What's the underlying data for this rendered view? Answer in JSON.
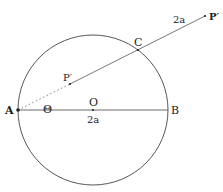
{
  "diagram": {
    "labels": {
      "A": "A",
      "B": "B",
      "O": "O",
      "C": "C",
      "P_inner": "P′",
      "P_outer": "P′",
      "theta": "Θ",
      "diameter": "2a",
      "segment_CP": "2a"
    },
    "colors": {
      "stroke": "#444444",
      "text": "#222222"
    }
  }
}
